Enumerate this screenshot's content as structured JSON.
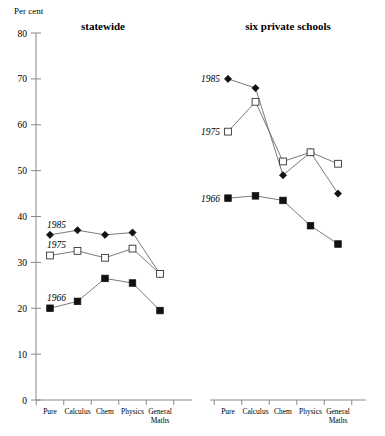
{
  "axis": {
    "unit_label": "Per cent",
    "y_ticks": [
      "0",
      "10",
      "20",
      "30",
      "40",
      "50",
      "60",
      "70",
      "80"
    ],
    "y_min": 0,
    "y_max": 80,
    "x_categories": [
      "Pure",
      "Calculus",
      "Chem",
      "Physics",
      "General Maths"
    ],
    "x_category_lines": [
      [
        "Pure"
      ],
      [
        "Calculus"
      ],
      [
        "Chem"
      ],
      [
        "Physics"
      ],
      [
        "General",
        "Maths"
      ]
    ]
  },
  "panels": [
    {
      "id": "statewide",
      "title": "statewide"
    },
    {
      "id": "six-private-schools",
      "title": "six private schools"
    }
  ],
  "series_labels": [
    "1985",
    "1975",
    "1966"
  ],
  "chart_data": {
    "type": "line",
    "title": "",
    "xlabel": "",
    "ylabel": "Per cent",
    "ylim": [
      0,
      80
    ],
    "grid": false,
    "legend_position": "inline-left-of-first-point",
    "categories": [
      "Pure",
      "Calculus",
      "Chem",
      "Physics",
      "General Maths"
    ],
    "panels": [
      {
        "name": "statewide",
        "series": [
          {
            "name": "1985",
            "marker": "filled-diamond",
            "values": [
              36,
              37,
              36,
              36.5,
              27.5
            ]
          },
          {
            "name": "1975",
            "marker": "open-square",
            "values": [
              31.5,
              32.5,
              31,
              33,
              27.5
            ]
          },
          {
            "name": "1966",
            "marker": "filled-square",
            "values": [
              20,
              21.5,
              26.5,
              25.5,
              19.5
            ]
          }
        ]
      },
      {
        "name": "six private schools",
        "series": [
          {
            "name": "1985",
            "marker": "filled-diamond",
            "values": [
              70,
              68,
              49,
              54,
              45
            ]
          },
          {
            "name": "1975",
            "marker": "open-square",
            "values": [
              58.5,
              65,
              52,
              54,
              51.5
            ]
          },
          {
            "name": "1966",
            "marker": "filled-square",
            "values": [
              44,
              44.5,
              43.5,
              38,
              34
            ]
          }
        ]
      }
    ]
  }
}
